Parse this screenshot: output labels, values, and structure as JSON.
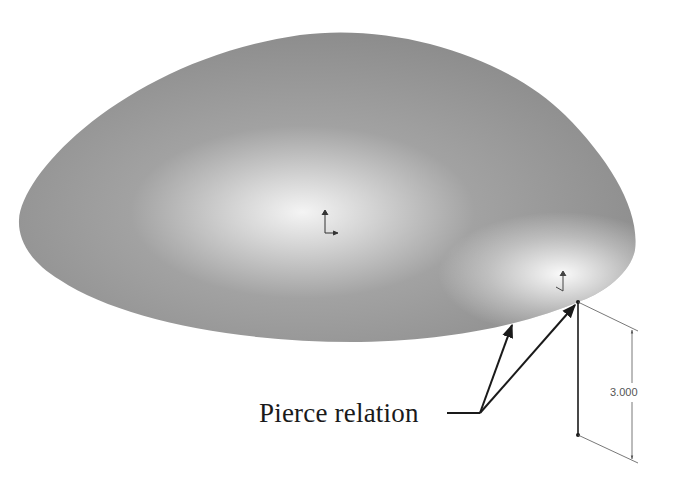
{
  "figure": {
    "colors": {
      "surface_base": "#8c8c8c",
      "surface_highlight": "#f2f2f2",
      "line": "#1a1a1a",
      "dimension": "#555555",
      "background": "#ffffff"
    }
  },
  "annotations": {
    "callout_label": "Pierce relation",
    "dimension_value": "3.000"
  },
  "icons": {
    "origin_triad_center": "coordinate-triad-icon",
    "origin_triad_corner": "coordinate-triad-icon"
  }
}
